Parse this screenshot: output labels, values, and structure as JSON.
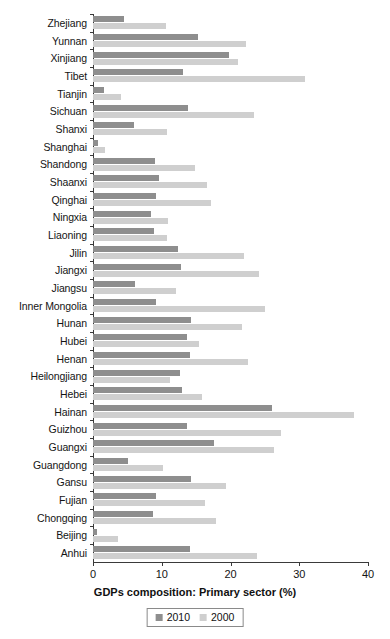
{
  "chart_data": {
    "type": "bar",
    "orientation": "horizontal",
    "title": "",
    "xlabel": "GDPs composition: Primary sector (%)",
    "ylabel": "",
    "xlim": [
      0,
      40
    ],
    "xticks": [
      0,
      10,
      20,
      30,
      40
    ],
    "grid": false,
    "legend_position": "bottom",
    "categories": [
      "Zhejiang",
      "Yunnan",
      "Xinjiang",
      "Tibet",
      "Tianjin",
      "Sichuan",
      "Shanxi",
      "Shanghai",
      "Shandong",
      "Shaanxi",
      "Qinghai",
      "Ningxia",
      "Liaoning",
      "Jilin",
      "Jiangxi",
      "Jiangsu",
      "Inner Mongolia",
      "Hunan",
      "Hubei",
      "Henan",
      "Heilongjiang",
      "Hebei",
      "Hainan",
      "Guizhou",
      "Guangxi",
      "Guangdong",
      "Gansu",
      "Fujian",
      "Chongqing",
      "Beijing",
      "Anhui"
    ],
    "series": [
      {
        "name": "2010",
        "color": "#8e8e8e",
        "values": [
          4.5,
          15.3,
          19.8,
          13.1,
          1.6,
          13.8,
          6.0,
          0.7,
          9.0,
          9.6,
          9.2,
          8.5,
          8.8,
          12.3,
          12.8,
          6.1,
          9.2,
          14.3,
          13.7,
          14.1,
          12.6,
          12.9,
          26.0,
          13.6,
          17.6,
          5.1,
          14.3,
          9.2,
          8.7,
          0.6,
          14.1
        ]
      },
      {
        "name": "2000",
        "color": "#cfcfcf",
        "values": [
          10.6,
          22.3,
          21.1,
          30.9,
          4.1,
          23.4,
          10.8,
          1.8,
          14.8,
          16.6,
          17.2,
          10.9,
          10.8,
          21.9,
          24.2,
          12.0,
          25.0,
          21.7,
          15.4,
          22.5,
          11.2,
          15.9,
          37.9,
          27.3,
          26.3,
          10.2,
          19.4,
          16.3,
          17.9,
          3.6,
          23.9
        ]
      }
    ]
  },
  "legend": {
    "items": [
      {
        "label": "2010",
        "swatch": "legend-swatch-2010"
      },
      {
        "label": "2000",
        "swatch": "legend-swatch-2000"
      }
    ]
  },
  "axis": {
    "x_title": "GDPs composition: Primary sector (%)",
    "tick_labels": [
      "0",
      "10",
      "20",
      "30",
      "40"
    ]
  },
  "colors": {
    "series_2010": "#8e8e8e",
    "series_2000": "#cfcfcf",
    "axis": "#3a3a3a",
    "text": "#141414",
    "background": "#ffffff"
  }
}
